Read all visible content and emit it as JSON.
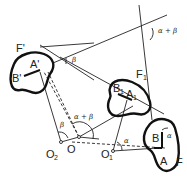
{
  "figure": {
    "type": "kinematic-geometry-diagram",
    "caption": ""
  },
  "bodies": [
    {
      "id": "F",
      "label": "F",
      "point_a": "A",
      "point_b": "B"
    },
    {
      "id": "F1",
      "label": "F",
      "label_sub": "1",
      "point_a": "A",
      "point_a_sub": "1",
      "point_b": "B",
      "point_b_sub": "1"
    },
    {
      "id": "F_prime",
      "label": "F'",
      "point_a": "A'",
      "point_b": "B'"
    }
  ],
  "labels": {
    "F": "F",
    "A": "A",
    "B": "B",
    "F1": "F",
    "F1_sub": "1",
    "A1": "A",
    "A1_sub": "1",
    "B1": "B",
    "B1_sub": "1",
    "F_prime": "F'",
    "A_prime": "A'",
    "B_prime": "B'"
  },
  "poles": {
    "O": "O",
    "O1": "O",
    "O1_sub": "1",
    "O2": "O",
    "O2_sub": "2"
  },
  "angles": {
    "alpha": "α",
    "beta": "β",
    "alpha_plus_beta": "α + β",
    "at_O1": "α",
    "at_B": "α",
    "at_O2": "β",
    "at_O": "α + β",
    "top_right": "α + β",
    "top_left": "β"
  }
}
